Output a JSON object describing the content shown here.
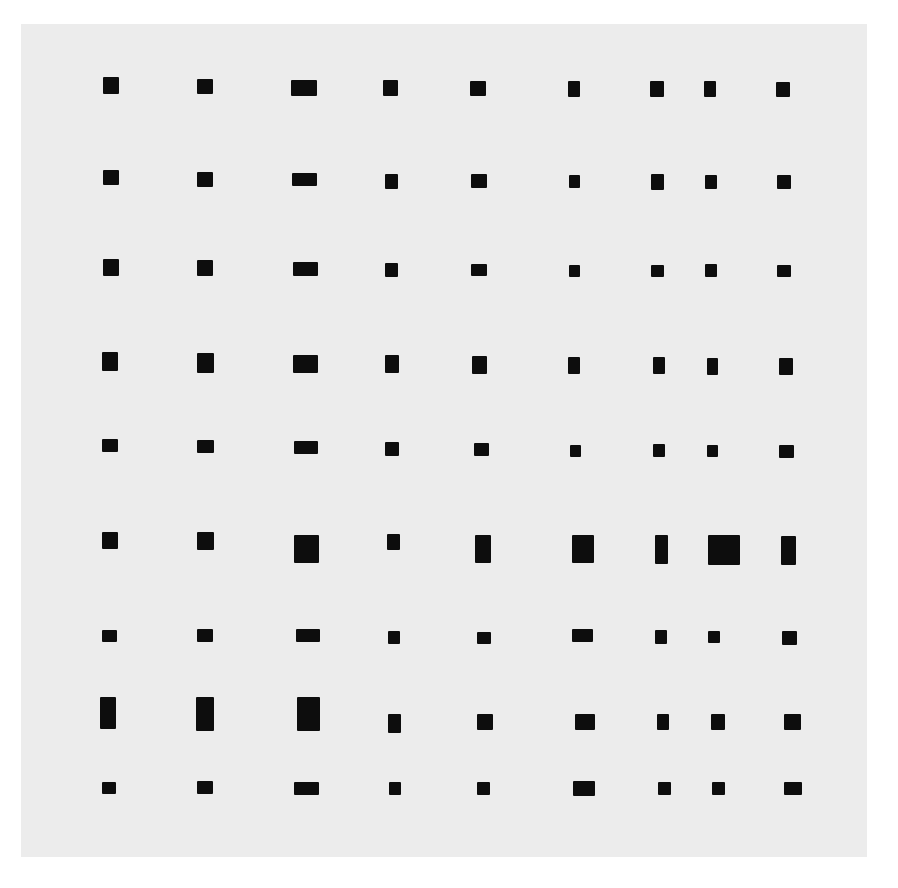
{
  "artwork": {
    "background_color": "#ececec",
    "mark_color": "#0d0d0d",
    "grid": {
      "rows": 9,
      "columns": 9
    },
    "rects": [
      [
        [
          103,
          77,
          16,
          17
        ],
        [
          197,
          79,
          16,
          15
        ],
        [
          291,
          80,
          26,
          16
        ],
        [
          383,
          80,
          15,
          16
        ],
        [
          470,
          81,
          16,
          15
        ],
        [
          568,
          81,
          12,
          16
        ],
        [
          650,
          81,
          14,
          16
        ],
        [
          704,
          81,
          12,
          16
        ],
        [
          776,
          82,
          14,
          15
        ]
      ],
      [
        [
          103,
          170,
          16,
          15
        ],
        [
          197,
          172,
          16,
          15
        ],
        [
          292,
          173,
          25,
          13
        ],
        [
          385,
          174,
          13,
          15
        ],
        [
          471,
          174,
          16,
          14
        ],
        [
          569,
          175,
          11,
          13
        ],
        [
          651,
          174,
          13,
          16
        ],
        [
          705,
          175,
          12,
          14
        ],
        [
          777,
          175,
          14,
          14
        ]
      ],
      [
        [
          103,
          259,
          16,
          17
        ],
        [
          197,
          260,
          16,
          16
        ],
        [
          293,
          262,
          25,
          14
        ],
        [
          385,
          263,
          13,
          14
        ],
        [
          471,
          264,
          16,
          12
        ],
        [
          569,
          265,
          11,
          12
        ],
        [
          651,
          265,
          13,
          12
        ],
        [
          705,
          264,
          12,
          13
        ],
        [
          777,
          265,
          14,
          12
        ]
      ],
      [
        [
          102,
          352,
          16,
          19
        ],
        [
          197,
          353,
          17,
          20
        ],
        [
          293,
          355,
          25,
          18
        ],
        [
          385,
          355,
          14,
          18
        ],
        [
          472,
          356,
          15,
          18
        ],
        [
          568,
          357,
          12,
          17
        ],
        [
          653,
          357,
          12,
          17
        ],
        [
          707,
          358,
          11,
          17
        ],
        [
          779,
          358,
          14,
          17
        ]
      ],
      [
        [
          102,
          439,
          16,
          13
        ],
        [
          197,
          440,
          17,
          13
        ],
        [
          294,
          441,
          24,
          13
        ],
        [
          385,
          442,
          14,
          14
        ],
        [
          474,
          443,
          15,
          13
        ],
        [
          570,
          445,
          11,
          12
        ],
        [
          653,
          444,
          12,
          13
        ],
        [
          707,
          445,
          11,
          12
        ],
        [
          779,
          445,
          15,
          13
        ]
      ],
      [
        [
          102,
          532,
          16,
          17
        ],
        [
          197,
          532,
          17,
          18
        ],
        [
          294,
          535,
          25,
          28
        ],
        [
          387,
          534,
          13,
          16
        ],
        [
          475,
          535,
          16,
          28
        ],
        [
          572,
          535,
          22,
          28
        ],
        [
          655,
          535,
          13,
          29
        ],
        [
          708,
          535,
          32,
          30
        ],
        [
          781,
          536,
          15,
          29
        ]
      ],
      [
        [
          102,
          630,
          15,
          12
        ],
        [
          197,
          629,
          16,
          13
        ],
        [
          296,
          629,
          24,
          13
        ],
        [
          388,
          631,
          12,
          13
        ],
        [
          477,
          632,
          14,
          12
        ],
        [
          572,
          629,
          21,
          13
        ],
        [
          655,
          630,
          12,
          14
        ],
        [
          708,
          631,
          12,
          12
        ],
        [
          782,
          631,
          15,
          14
        ]
      ],
      [
        [
          100,
          697,
          16,
          32
        ],
        [
          196,
          697,
          18,
          34
        ],
        [
          297,
          697,
          23,
          34
        ],
        [
          388,
          714,
          13,
          19
        ],
        [
          477,
          714,
          16,
          16
        ],
        [
          575,
          714,
          20,
          16
        ],
        [
          657,
          714,
          12,
          16
        ],
        [
          711,
          714,
          14,
          16
        ],
        [
          784,
          714,
          17,
          16
        ]
      ],
      [
        [
          102,
          782,
          14,
          12
        ],
        [
          197,
          781,
          16,
          13
        ],
        [
          294,
          782,
          25,
          13
        ],
        [
          389,
          782,
          12,
          13
        ],
        [
          477,
          782,
          13,
          13
        ],
        [
          573,
          781,
          22,
          15
        ],
        [
          658,
          782,
          13,
          13
        ],
        [
          712,
          782,
          13,
          13
        ],
        [
          784,
          782,
          18,
          13
        ]
      ]
    ]
  }
}
